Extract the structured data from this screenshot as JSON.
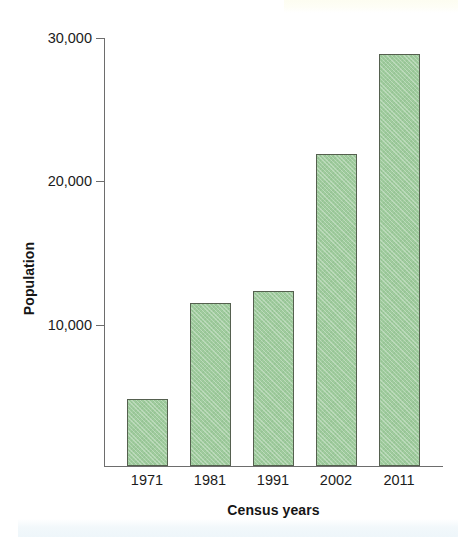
{
  "chart_data": {
    "type": "bar",
    "title": "",
    "subtitle": "",
    "xlabel": "Census years",
    "ylabel": "Population",
    "categories": [
      "1971",
      "1981",
      "1991",
      "2002",
      "2011"
    ],
    "values": [
      4700,
      11400,
      12250,
      21900,
      28900
    ],
    "series": [
      {
        "name": "Population",
        "values": [
          4700,
          11400,
          12250,
          21900,
          28900
        ]
      }
    ],
    "ylim": [
      0,
      30000
    ],
    "xlim_categories": 5,
    "ytick_labels": [
      "30,000",
      "20,000",
      "10,000"
    ],
    "ytick_values": [
      30000,
      20000,
      10000
    ],
    "grid": false,
    "legend": null,
    "legend_position": "none",
    "annotations": [],
    "bar_fill_color": "#9fcb9d",
    "bar_border_color": "#55604f",
    "axis_color": "#6d6d6d",
    "text_color": "#1b1b1b"
  },
  "figure": {
    "ylabel": "Population",
    "xlabel": "Census years",
    "ytick_labels": [
      "30,000",
      "20,000",
      "10,000"
    ],
    "xtick_labels": [
      "1971",
      "1981",
      "1991",
      "2002",
      "2011"
    ]
  }
}
